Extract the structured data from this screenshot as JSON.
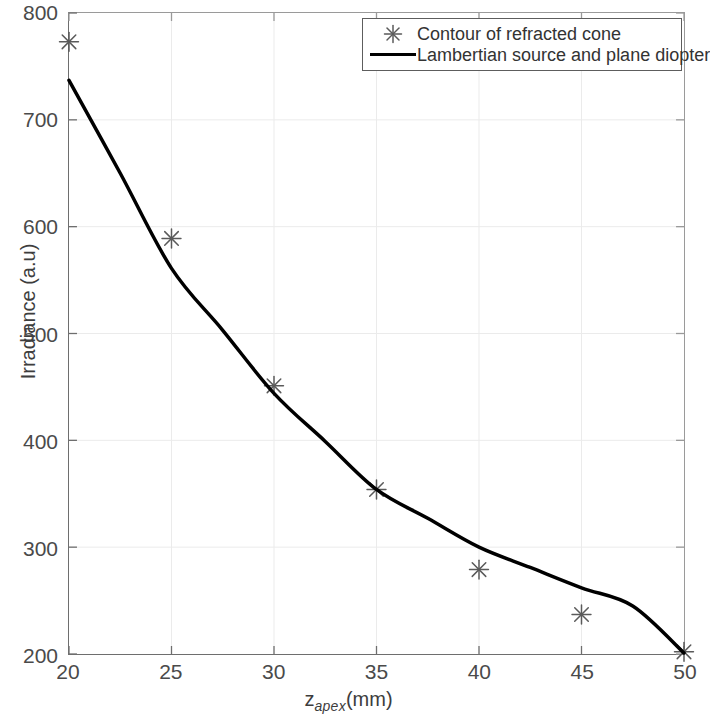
{
  "chart_data": {
    "type": "line",
    "title": "",
    "xlabel": "z_apex (mm)",
    "xlabel_base": "z",
    "xlabel_sub": "apex",
    "xlabel_unit": "(mm)",
    "ylabel": "Irradiance (a.u)",
    "xlim": [
      20,
      50
    ],
    "ylim": [
      200,
      800
    ],
    "xticks": [
      20,
      25,
      30,
      35,
      40,
      45,
      50
    ],
    "yticks": [
      200,
      300,
      400,
      500,
      600,
      700,
      800
    ],
    "xtick_labels": [
      "20",
      "25",
      "30",
      "35",
      "40",
      "45",
      "50"
    ],
    "ytick_labels": [
      "200",
      "300",
      "400",
      "500",
      "600",
      "700",
      "800"
    ],
    "grid": true,
    "grid_color": "#ebebeb",
    "legend_position": "top-right",
    "series": [
      {
        "name": "Contour of refracted cone",
        "type": "scatter",
        "marker": "asterisk",
        "color": "#5a5a5a",
        "x": [
          20,
          25,
          30,
          35,
          40,
          45,
          50
        ],
        "values": [
          773,
          589,
          451,
          354,
          279,
          237,
          202
        ]
      },
      {
        "name": "Lambertian source and plane diopter",
        "type": "line",
        "color": "#000000",
        "linewidth": 3.5,
        "x": [
          20,
          22.5,
          25,
          27.5,
          30,
          32.5,
          35,
          37.5,
          40,
          42.5,
          45,
          47.5,
          50
        ],
        "values": [
          737,
          650,
          561,
          503,
          444,
          399,
          354,
          327,
          300,
          281,
          262,
          245,
          201
        ]
      }
    ]
  },
  "legend": {
    "items": [
      {
        "label": "Contour of refracted cone",
        "key": "asterisk-marker"
      },
      {
        "label": "Lambertian source and plane diopter",
        "key": "line-swatch"
      }
    ]
  }
}
